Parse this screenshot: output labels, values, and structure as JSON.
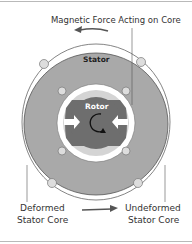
{
  "diagram": {
    "labels": {
      "force": "Magnetic Force Acting on Core",
      "stator": "Stator",
      "rotor": "Rotor",
      "deformed_line1": "Deformed",
      "deformed_line2": "Stator Core",
      "undeformed_line1": "Undeformed",
      "undeformed_line2": "Stator Core"
    },
    "colors": {
      "stator": "#a9a9a9",
      "rotor_dark": "#6e6e6e",
      "rotor_light": "#d4d4d4",
      "arrow": "#555555",
      "text": "#333333"
    }
  }
}
